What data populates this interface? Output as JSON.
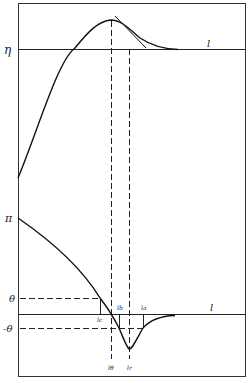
{
  "figure": {
    "colors": {
      "ink": "#1a1a1a",
      "background": "#ffffff"
    }
  },
  "upper_panel": {
    "y_label": "η",
    "x_label": "l",
    "curve": "rises from left edge to a peak, then decays asymptotically to the η line, with a tangent line drawn at the inflection"
  },
  "lower_panel": {
    "y_labels": {
      "pi": "π",
      "theta": "θ",
      "neg_theta": "-θ"
    },
    "x_label": "l",
    "curve": "decreases from π, crosses zero, dips to a minimum below -θ, and returns toward zero",
    "point_labels": {
      "lc": "lc",
      "lb": "lb",
      "la": "la",
      "ltheta": "lθ",
      "lr": "lr"
    }
  }
}
